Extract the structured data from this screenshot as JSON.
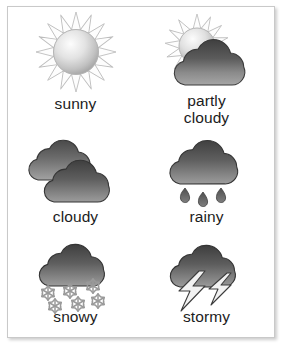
{
  "card": {
    "title": "Weather icons chart",
    "background_color": "#ffffff",
    "border_color": "#c9c9c9",
    "label_color": "#1c1c1c"
  },
  "palette": {
    "cloud_dark": "#4a4a4a",
    "cloud_mid": "#6e6e6e",
    "cloud_light": "#9e9e9e",
    "cloud_outline": "#3a3a3a",
    "sun_light": "#fbfbfb",
    "sun_mid": "#d8d8d8",
    "sun_shade": "#a8a8a8",
    "sun_outline": "#b5b5b5",
    "ray_fill": "#fdfdfd",
    "ray_outline": "#bdbdbd",
    "snow_fill": "#dcdcdc",
    "snow_outline": "#9a9a9a",
    "bolt_fill": "#f2f2f2",
    "bolt_outline": "#3d3d3d",
    "drop_fill": "#5a5a5a"
  },
  "grid": {
    "columns": 2,
    "rows": 3,
    "items": [
      {
        "id": "sunny",
        "label": "sunny",
        "icon": "sun-icon",
        "row": 1,
        "column": 1
      },
      {
        "id": "partly-cloudy",
        "label": "partly\ncloudy",
        "icon": "sun-behind-cloud-icon",
        "row": 1,
        "column": 2
      },
      {
        "id": "cloudy",
        "label": "cloudy",
        "icon": "double-cloud-icon",
        "row": 2,
        "column": 1
      },
      {
        "id": "rainy",
        "label": "rainy",
        "icon": "cloud-rain-icon",
        "row": 2,
        "column": 2
      },
      {
        "id": "snowy",
        "label": "snowy",
        "icon": "cloud-snow-icon",
        "row": 3,
        "column": 1
      },
      {
        "id": "stormy",
        "label": "stormy",
        "icon": "cloud-lightning-icon",
        "row": 3,
        "column": 2
      }
    ]
  }
}
